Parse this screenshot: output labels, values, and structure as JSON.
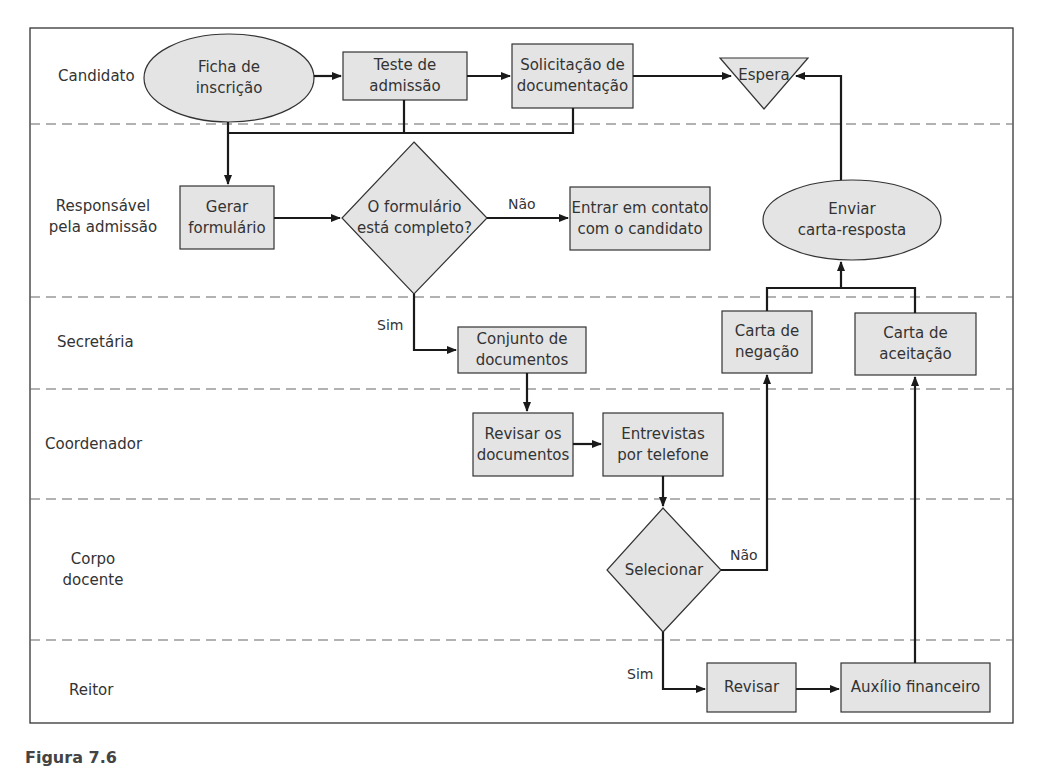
{
  "diagram": {
    "type": "swimlane-flowchart",
    "colors": {
      "node_fill": "#e6e6e6",
      "stroke": "#1a1a1a",
      "lane_divider": "#666666"
    },
    "lanes": [
      {
        "id": "candidato",
        "label": "Candidato"
      },
      {
        "id": "responsavel",
        "label": "Responsável pela admissão",
        "line1": "Responsável",
        "line2": "pela admissão"
      },
      {
        "id": "secretaria",
        "label": "Secretária"
      },
      {
        "id": "coordenador",
        "label": "Coordenador"
      },
      {
        "id": "corpo",
        "label": "Corpo docente",
        "line1": "Corpo",
        "line2": "docente"
      },
      {
        "id": "reitor",
        "label": "Reitor"
      }
    ],
    "nodes": {
      "ficha": {
        "shape": "ellipse",
        "lane": "candidato",
        "line1": "Ficha de",
        "line2": "inscrição"
      },
      "teste": {
        "shape": "rect",
        "lane": "candidato",
        "line1": "Teste de",
        "line2": "admissão"
      },
      "solicitacao": {
        "shape": "rect",
        "lane": "candidato",
        "line1": "Solicitação de",
        "line2": "documentação"
      },
      "espera": {
        "shape": "triangle-down",
        "lane": "candidato",
        "line1": "Espera"
      },
      "gerar": {
        "shape": "rect",
        "lane": "responsavel",
        "line1": "Gerar",
        "line2": "formulário"
      },
      "completo": {
        "shape": "diamond",
        "lane": "responsavel",
        "line1": "O formulário",
        "line2": "está completo?"
      },
      "contato": {
        "shape": "rect",
        "lane": "responsavel",
        "line1": "Entrar em contato",
        "line2": "com o candidato"
      },
      "enviar": {
        "shape": "ellipse",
        "lane": "responsavel",
        "line1": "Enviar",
        "line2": "carta-resposta"
      },
      "conjunto": {
        "shape": "rect",
        "lane": "secretaria",
        "line1": "Conjunto de",
        "line2": "documentos"
      },
      "negacao": {
        "shape": "rect",
        "lane": "secretaria",
        "line1": "Carta de",
        "line2": "negação"
      },
      "aceitacao": {
        "shape": "rect",
        "lane": "secretaria",
        "line1": "Carta de",
        "line2": "aceitação"
      },
      "revisar_docs": {
        "shape": "rect",
        "lane": "coordenador",
        "line1": "Revisar os",
        "line2": "documentos"
      },
      "entrevistas": {
        "shape": "rect",
        "lane": "coordenador",
        "line1": "Entrevistas",
        "line2": "por telefone"
      },
      "selecionar": {
        "shape": "diamond",
        "lane": "corpo",
        "line1": "Selecionar"
      },
      "revisar": {
        "shape": "rect",
        "lane": "reitor",
        "line1": "Revisar"
      },
      "auxilio": {
        "shape": "rect",
        "lane": "reitor",
        "line1": "Auxílio financeiro"
      }
    },
    "edges": [
      {
        "from": "ficha",
        "to": "teste"
      },
      {
        "from": "teste",
        "to": "solicitacao"
      },
      {
        "from": "solicitacao",
        "to": "espera"
      },
      {
        "from": "ficha",
        "to": "gerar"
      },
      {
        "from": "teste",
        "to": "gerar"
      },
      {
        "from": "solicitacao",
        "to": "gerar"
      },
      {
        "from": "gerar",
        "to": "completo"
      },
      {
        "from": "completo",
        "to": "contato",
        "label": "Não"
      },
      {
        "from": "completo",
        "to": "conjunto",
        "label": "Sim"
      },
      {
        "from": "conjunto",
        "to": "revisar_docs"
      },
      {
        "from": "revisar_docs",
        "to": "entrevistas"
      },
      {
        "from": "entrevistas",
        "to": "selecionar"
      },
      {
        "from": "selecionar",
        "to": "negacao",
        "label": "Não"
      },
      {
        "from": "selecionar",
        "to": "revisar",
        "label": "Sim"
      },
      {
        "from": "revisar",
        "to": "auxilio"
      },
      {
        "from": "auxilio",
        "to": "aceitacao"
      },
      {
        "from": "negacao",
        "to": "enviar"
      },
      {
        "from": "aceitacao",
        "to": "enviar"
      },
      {
        "from": "enviar",
        "to": "espera"
      }
    ],
    "edge_labels": {
      "nao": "Não",
      "sim": "Sim"
    }
  },
  "caption": "Figura 7.6"
}
